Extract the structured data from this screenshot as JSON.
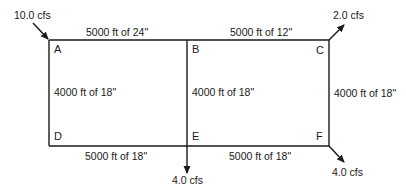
{
  "diagram": {
    "type": "pipe-network",
    "line_color": "#1a1a1a",
    "nodes": [
      {
        "id": "A",
        "label": "A"
      },
      {
        "id": "B",
        "label": "B"
      },
      {
        "id": "C",
        "label": "C"
      },
      {
        "id": "D",
        "label": "D"
      },
      {
        "id": "E",
        "label": "E"
      },
      {
        "id": "F",
        "label": "F"
      }
    ],
    "pipes": [
      {
        "from": "A",
        "to": "B",
        "label": "5000 ft of 24\""
      },
      {
        "from": "B",
        "to": "C",
        "label": "5000 ft of 12\""
      },
      {
        "from": "A",
        "to": "D",
        "label": "4000 ft of 18\""
      },
      {
        "from": "B",
        "to": "E",
        "label": "4000 ft of 18\""
      },
      {
        "from": "C",
        "to": "F",
        "label": "4000 ft of 18\""
      },
      {
        "from": "D",
        "to": "E",
        "label": "5000 ft of 18\""
      },
      {
        "from": "E",
        "to": "F",
        "label": "5000 ft of 18\""
      }
    ],
    "flows": [
      {
        "node": "A",
        "direction": "inflow",
        "label": "10.0 cfs"
      },
      {
        "node": "C",
        "direction": "outflow",
        "label": "2.0 cfs"
      },
      {
        "node": "E",
        "direction": "outflow",
        "label": "4.0 cfs"
      },
      {
        "node": "F",
        "direction": "outflow",
        "label": "4.0 cfs"
      }
    ]
  }
}
